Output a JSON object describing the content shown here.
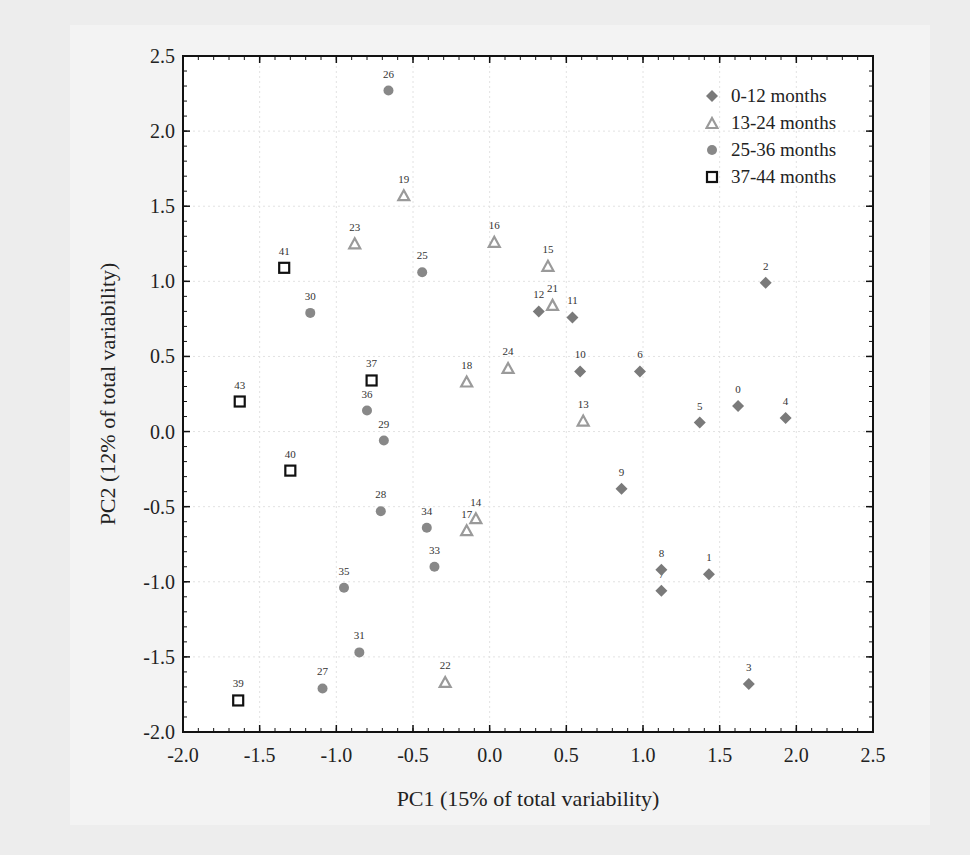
{
  "chart_data": {
    "type": "scatter",
    "title": "",
    "xlabel": "PC1 (15% of total variability)",
    "ylabel": "PC2 (12% of total variability)",
    "xlim": [
      -2.0,
      2.5
    ],
    "ylim": [
      -2.0,
      2.5
    ],
    "xticks": [
      "-2.0",
      "-1.5",
      "-1.0",
      "-0.5",
      "0.0",
      "0.5",
      "1.0",
      "1.5",
      "2.0",
      "2.5"
    ],
    "yticks": [
      "-2.0",
      "-1.5",
      "-1.0",
      "-0.5",
      "0.0",
      "0.5",
      "1.0",
      "1.5",
      "2.0",
      "2.5"
    ],
    "grid": true,
    "legend_position": "upper right",
    "series": [
      {
        "name": "0-12 months",
        "marker": "diamond",
        "color": "#7a7a7a",
        "points": [
          {
            "label": "0",
            "x": 1.62,
            "y": 0.17
          },
          {
            "label": "1",
            "x": 1.43,
            "y": -0.95
          },
          {
            "label": "2",
            "x": 1.8,
            "y": 0.99
          },
          {
            "label": "3",
            "x": 1.69,
            "y": -1.68
          },
          {
            "label": "4",
            "x": 1.93,
            "y": 0.09
          },
          {
            "label": "5",
            "x": 1.37,
            "y": 0.06
          },
          {
            "label": "6",
            "x": 0.98,
            "y": 0.4
          },
          {
            "label": "7",
            "x": 1.12,
            "y": -1.06
          },
          {
            "label": "8",
            "x": 1.12,
            "y": -0.92
          },
          {
            "label": "9",
            "x": 0.86,
            "y": -0.38
          },
          {
            "label": "10",
            "x": 0.59,
            "y": 0.4
          },
          {
            "label": "11",
            "x": 0.54,
            "y": 0.76
          },
          {
            "label": "12",
            "x": 0.32,
            "y": 0.8
          }
        ]
      },
      {
        "name": "13-24 months",
        "marker": "triangle-open",
        "color": "#9a9a9a",
        "points": [
          {
            "label": "13",
            "x": 0.61,
            "y": 0.07
          },
          {
            "label": "14",
            "x": -0.09,
            "y": -0.58
          },
          {
            "label": "15",
            "x": 0.38,
            "y": 1.1
          },
          {
            "label": "16",
            "x": 0.03,
            "y": 1.26
          },
          {
            "label": "17",
            "x": -0.15,
            "y": -0.66
          },
          {
            "label": "18",
            "x": -0.15,
            "y": 0.33
          },
          {
            "label": "19",
            "x": -0.56,
            "y": 1.57
          },
          {
            "label": "21",
            "x": 0.41,
            "y": 0.84
          },
          {
            "label": "22",
            "x": -0.29,
            "y": -1.67
          },
          {
            "label": "23",
            "x": -0.88,
            "y": 1.25
          },
          {
            "label": "24",
            "x": 0.12,
            "y": 0.42
          }
        ]
      },
      {
        "name": "25-36 months",
        "marker": "circle",
        "color": "#888888",
        "points": [
          {
            "label": "25",
            "x": -0.44,
            "y": 1.06
          },
          {
            "label": "26",
            "x": -0.66,
            "y": 2.27
          },
          {
            "label": "27",
            "x": -1.09,
            "y": -1.71
          },
          {
            "label": "28",
            "x": -0.71,
            "y": -0.53
          },
          {
            "label": "29",
            "x": -0.69,
            "y": -0.06
          },
          {
            "label": "30",
            "x": -1.17,
            "y": 0.79
          },
          {
            "label": "31",
            "x": -0.85,
            "y": -1.47
          },
          {
            "label": "33",
            "x": -0.36,
            "y": -0.9
          },
          {
            "label": "34",
            "x": -0.41,
            "y": -0.64
          },
          {
            "label": "35",
            "x": -0.95,
            "y": -1.04
          },
          {
            "label": "36",
            "x": -0.8,
            "y": 0.14
          }
        ]
      },
      {
        "name": "37-44 months",
        "marker": "square-open",
        "color": "#111111",
        "points": [
          {
            "label": "37",
            "x": -0.77,
            "y": 0.34
          },
          {
            "label": "39",
            "x": -1.64,
            "y": -1.79
          },
          {
            "label": "40",
            "x": -1.3,
            "y": -0.26
          },
          {
            "label": "41",
            "x": -1.34,
            "y": 1.09
          },
          {
            "label": "43",
            "x": -1.63,
            "y": 0.2
          }
        ]
      }
    ]
  }
}
